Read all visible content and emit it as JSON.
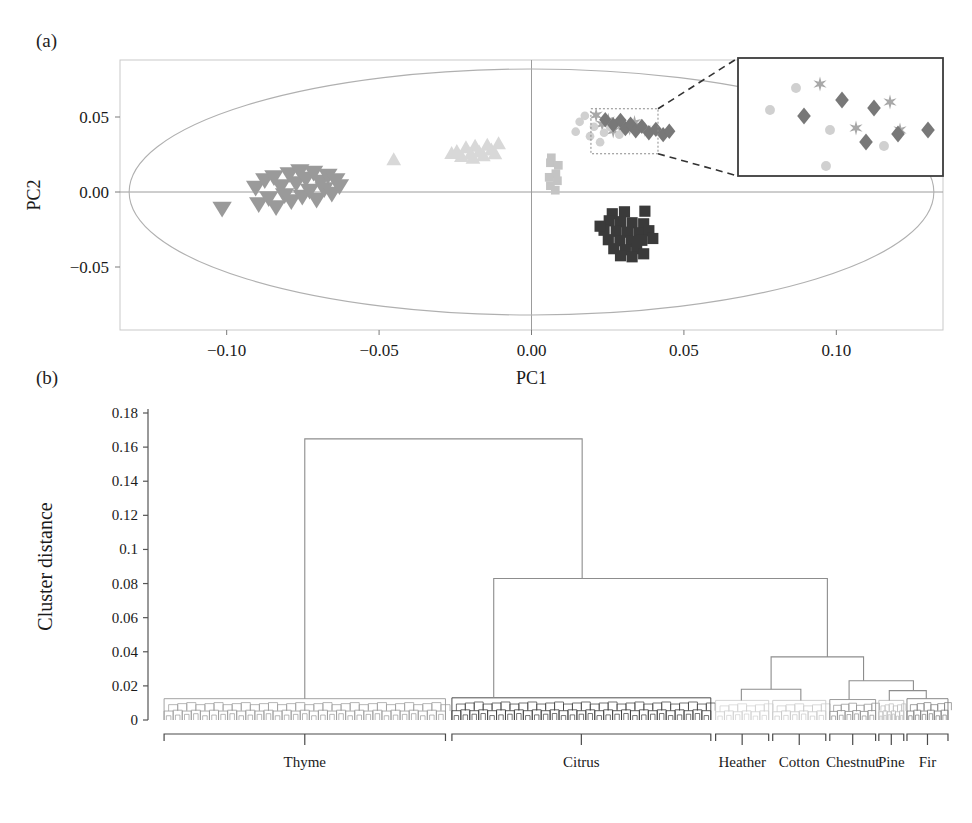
{
  "figure": {
    "panel_a_label": "(a)",
    "panel_b_label": "(b)"
  },
  "chart_data": [
    {
      "id": "pca-scatter",
      "type": "scatter",
      "title": "",
      "xlabel": "PC1",
      "ylabel": "PC2",
      "xlim": [
        -0.135,
        0.135
      ],
      "ylim": [
        -0.092,
        0.088
      ],
      "xticks": [
        "-0.10",
        "-0.05",
        "0.00",
        "0.05",
        "0.10"
      ],
      "xtick_values": [
        -0.1,
        -0.05,
        0.0,
        0.05,
        0.1
      ],
      "yticks": [
        "0.05",
        "0.00",
        "-0.05"
      ],
      "ytick_values": [
        0.05,
        0.0,
        -0.05
      ],
      "grid": false,
      "hotelling_ellipse": {
        "cx": 0.0,
        "cy": 0.0,
        "rx": 0.132,
        "ry": 0.082
      },
      "inset": {
        "source_box": {
          "x0": 0.0195,
          "y0": 0.0255,
          "x1": 0.0415,
          "y1": 0.0555
        },
        "dest_box_px": {
          "x": 738,
          "y": 58,
          "w": 205,
          "h": 118
        },
        "zoom_callout": true
      },
      "series": [
        {
          "name": "Thyme",
          "marker": "triangle-down",
          "color": "#9a9a9a",
          "points": [
            [
              -0.1015,
              -0.011
            ],
            [
              -0.0905,
              0.003
            ],
            [
              -0.0895,
              -0.008
            ],
            [
              -0.0875,
              0.008
            ],
            [
              -0.0862,
              -0.004
            ],
            [
              -0.0845,
              0.01
            ],
            [
              -0.0838,
              -0.01
            ],
            [
              -0.0822,
              0.004
            ],
            [
              -0.081,
              -0.002
            ],
            [
              -0.0795,
              0.012
            ],
            [
              -0.0788,
              -0.006
            ],
            [
              -0.0772,
              0.006
            ],
            [
              -0.076,
              0.014
            ],
            [
              -0.0752,
              -0.003
            ],
            [
              -0.074,
              0.009
            ],
            [
              -0.0728,
              0.001
            ],
            [
              -0.0715,
              0.013
            ],
            [
              -0.0705,
              -0.005
            ],
            [
              -0.0692,
              0.007
            ],
            [
              -0.068,
              0.002
            ],
            [
              -0.0668,
              0.011
            ],
            [
              -0.0655,
              -0.001
            ],
            [
              -0.0642,
              0.008
            ],
            [
              -0.063,
              0.004
            ]
          ]
        },
        {
          "name": "Citrus-light",
          "marker": "triangle-up",
          "color": "#d8d8d8",
          "points": [
            [
              -0.0452,
              0.0215
            ],
            [
              -0.0245,
              0.027
            ],
            [
              -0.023,
              0.0238
            ],
            [
              -0.0215,
              0.0295
            ],
            [
              -0.02,
              0.0252
            ],
            [
              -0.0185,
              0.0305
            ],
            [
              -0.0172,
              0.0268
            ],
            [
              -0.0158,
              0.0242
            ],
            [
              -0.0145,
              0.0312
            ],
            [
              -0.0132,
              0.028
            ],
            [
              -0.012,
              0.0255
            ],
            [
              -0.0108,
              0.0322
            ],
            [
              -0.0262,
              0.0258
            ],
            [
              -0.0192,
              0.0225
            ]
          ]
        },
        {
          "name": "Cotton",
          "marker": "square",
          "color": "#c4c4c4",
          "points": [
            [
              0.0065,
              0.0228
            ],
            [
              0.0062,
              0.0195
            ],
            [
              0.0088,
              0.0178
            ],
            [
              0.008,
              0.0122
            ],
            [
              0.0058,
              0.0098
            ],
            [
              0.0085,
              0.0075
            ],
            [
              0.0062,
              0.0042
            ],
            [
              0.0078,
              0.0012
            ]
          ]
        },
        {
          "name": "Chestnut",
          "marker": "square-dark",
          "color": "#3a3a3a",
          "points": [
            [
              0.0265,
              -0.0145
            ],
            [
              0.0305,
              -0.0132
            ],
            [
              0.0372,
              -0.0128
            ],
            [
              0.0255,
              -0.0192
            ],
            [
              0.0292,
              -0.0198
            ],
            [
              0.033,
              -0.0205
            ],
            [
              0.0368,
              -0.0212
            ],
            [
              0.0238,
              -0.0255
            ],
            [
              0.0278,
              -0.0262
            ],
            [
              0.0315,
              -0.0268
            ],
            [
              0.0352,
              -0.0272
            ],
            [
              0.0385,
              -0.0258
            ],
            [
              0.0252,
              -0.0318
            ],
            [
              0.029,
              -0.0325
            ],
            [
              0.0328,
              -0.033
            ],
            [
              0.0362,
              -0.0322
            ],
            [
              0.027,
              -0.0378
            ],
            [
              0.0308,
              -0.0385
            ],
            [
              0.0345,
              -0.0378
            ],
            [
              0.0292,
              -0.0425
            ],
            [
              0.033,
              -0.0432
            ],
            [
              0.0368,
              -0.0412
            ],
            [
              0.0225,
              -0.0228
            ],
            [
              0.0398,
              -0.031
            ]
          ]
        },
        {
          "name": "Pine",
          "marker": "star",
          "color": "#a8a8a8",
          "points": [
            [
              0.0212,
              0.0512
            ],
            [
              0.0252,
              0.0478
            ],
            [
              0.0288,
              0.0448
            ],
            [
              0.0322,
              0.0425
            ],
            [
              0.0338,
              0.0462
            ],
            [
              0.0372,
              0.0418
            ],
            [
              0.0232,
              0.0452
            ],
            [
              0.0268,
              0.0408
            ]
          ]
        },
        {
          "name": "Heather",
          "marker": "circle",
          "color": "#d0d0d0",
          "points": [
            [
              0.0158,
              0.0468
            ],
            [
              0.0175,
              0.0508
            ],
            [
              0.0205,
              0.0435
            ],
            [
              0.0238,
              0.0395
            ],
            [
              0.0258,
              0.0432
            ],
            [
              0.0288,
              0.0382
            ],
            [
              0.0312,
              0.0418
            ],
            [
              0.0225,
              0.0332
            ],
            [
              0.0145,
              0.0402
            ],
            [
              0.0192,
              0.0372
            ]
          ]
        },
        {
          "name": "Fir",
          "marker": "diamond",
          "color": "#787878",
          "points": [
            [
              0.0242,
              0.0482
            ],
            [
              0.0268,
              0.0448
            ],
            [
              0.0292,
              0.0478
            ],
            [
              0.0308,
              0.0422
            ],
            [
              0.0325,
              0.0452
            ],
            [
              0.0342,
              0.0408
            ],
            [
              0.0362,
              0.0438
            ],
            [
              0.0385,
              0.0395
            ],
            [
              0.0408,
              0.0418
            ],
            [
              0.0432,
              0.0382
            ],
            [
              0.0452,
              0.0405
            ]
          ]
        }
      ],
      "inset_points": [
        {
          "marker": "circle",
          "color": "#d0d0d0",
          "x": 32,
          "y": 52
        },
        {
          "marker": "circle",
          "color": "#d0d0d0",
          "x": 58,
          "y": 30
        },
        {
          "marker": "star",
          "color": "#a8a8a8",
          "x": 82,
          "y": 26
        },
        {
          "marker": "diamond",
          "color": "#787878",
          "x": 66,
          "y": 58
        },
        {
          "marker": "diamond",
          "color": "#787878",
          "x": 104,
          "y": 42
        },
        {
          "marker": "circle",
          "color": "#d0d0d0",
          "x": 92,
          "y": 72
        },
        {
          "marker": "star",
          "color": "#a8a8a8",
          "x": 118,
          "y": 70
        },
        {
          "marker": "diamond",
          "color": "#787878",
          "x": 136,
          "y": 50
        },
        {
          "marker": "star",
          "color": "#a8a8a8",
          "x": 152,
          "y": 44
        },
        {
          "marker": "diamond",
          "color": "#787878",
          "x": 128,
          "y": 84
        },
        {
          "marker": "star",
          "color": "#a8a8a8",
          "x": 162,
          "y": 72
        },
        {
          "marker": "diamond",
          "color": "#787878",
          "x": 160,
          "y": 76
        },
        {
          "marker": "diamond",
          "color": "#787878",
          "x": 190,
          "y": 72
        },
        {
          "marker": "circle",
          "color": "#d0d0d0",
          "x": 88,
          "y": 108
        },
        {
          "marker": "circle",
          "color": "#d0d0d0",
          "x": 146,
          "y": 88
        }
      ]
    },
    {
      "id": "dendrogram",
      "type": "tree",
      "title": "",
      "xlabel": "",
      "ylabel": "Cluster distance",
      "ylim": [
        0,
        0.18
      ],
      "yticks": [
        "0",
        "0.02",
        "0.04",
        "0.06",
        "0.08",
        "0.1",
        "0.12",
        "0.14",
        "0.16",
        "0.18"
      ],
      "ytick_values": [
        0,
        0.02,
        0.04,
        0.06,
        0.08,
        0.1,
        0.12,
        0.14,
        0.16,
        0.18
      ],
      "grid": false,
      "groups": [
        {
          "label": "Thyme",
          "x0": 0.02,
          "x1": 0.37,
          "color": "#9a9a9a",
          "leaf_h": 0.0125
        },
        {
          "label": "Citrus",
          "x0": 0.378,
          "x1": 0.7,
          "color": "#3a3a3a",
          "leaf_h": 0.013
        },
        {
          "label": "Heather",
          "x0": 0.706,
          "x1": 0.772,
          "color": "#d0d0d0",
          "leaf_h": 0.0115
        },
        {
          "label": "Cotton",
          "x0": 0.777,
          "x1": 0.843,
          "color": "#c9c9c9",
          "leaf_h": 0.0115
        },
        {
          "label": "Chestnut",
          "x0": 0.848,
          "x1": 0.905,
          "color": "#8f8f8f",
          "leaf_h": 0.012
        },
        {
          "label": "Pine",
          "x0": 0.909,
          "x1": 0.94,
          "color": "#bdbdbd",
          "leaf_h": 0.0115
        },
        {
          "label": "Fir",
          "x0": 0.944,
          "x1": 0.995,
          "color": "#7d7d7d",
          "leaf_h": 0.0125
        }
      ],
      "merges": [
        {
          "name": "root",
          "left_x": 0.195,
          "right_x": 0.54,
          "height": 0.1648,
          "left_h": 0.0125,
          "right_h": 0.083
        },
        {
          "name": "citrus-vs-rest",
          "left_x": 0.43,
          "right_x": 0.845,
          "height": 0.083,
          "left_h": 0.013,
          "right_h": 0.037
        },
        {
          "name": "heather-cotton-chestnut-pine-fir",
          "left_x": 0.775,
          "right_x": 0.89,
          "height": 0.037,
          "left_h": 0.018,
          "right_h": 0.023
        },
        {
          "name": "heather-cotton",
          "left_x": 0.738,
          "right_x": 0.812,
          "height": 0.018,
          "left_h": 0.0115,
          "right_h": 0.0115
        },
        {
          "name": "chestnut-pinefir",
          "left_x": 0.872,
          "right_x": 0.952,
          "height": 0.023,
          "left_h": 0.012,
          "right_h": 0.0172
        },
        {
          "name": "pine-fir",
          "left_x": 0.922,
          "right_x": 0.968,
          "height": 0.0172,
          "left_h": 0.0115,
          "right_h": 0.0125
        }
      ]
    }
  ]
}
